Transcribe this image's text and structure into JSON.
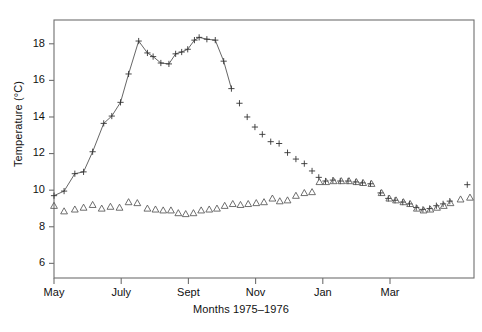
{
  "chart_data": {
    "type": "scatter",
    "title": "",
    "subtitle": "",
    "xlabel": "Months 1975–1976",
    "ylabel": "Temperature (°C)",
    "xlim": [
      0,
      12.5
    ],
    "ylim": [
      5.2,
      19.3
    ],
    "grid": false,
    "legend_position": "none",
    "y_ticks": [
      6,
      8,
      10,
      12,
      14,
      16,
      18
    ],
    "y_tick_labels": [
      "6",
      "8",
      "10",
      "12",
      "14",
      "16",
      "18"
    ],
    "x_ticks": [
      0,
      2,
      4,
      6,
      8,
      10
    ],
    "x_tick_labels": [
      "May",
      "July",
      "Sept",
      "Nov",
      "Jan",
      "Mar"
    ],
    "marker_styles": {
      "surface": "plus",
      "bottom": "triangle-up"
    },
    "annotations": [],
    "series": [
      {
        "name": "surface",
        "marker": "plus",
        "connected_through_x": 5.35,
        "points": [
          {
            "x": 0.0,
            "y": 9.7
          },
          {
            "x": 0.3,
            "y": 9.95
          },
          {
            "x": 0.62,
            "y": 10.9
          },
          {
            "x": 0.88,
            "y": 11.0
          },
          {
            "x": 1.15,
            "y": 12.1
          },
          {
            "x": 1.48,
            "y": 13.65
          },
          {
            "x": 1.72,
            "y": 14.05
          },
          {
            "x": 1.98,
            "y": 14.8
          },
          {
            "x": 2.22,
            "y": 16.35
          },
          {
            "x": 2.52,
            "y": 18.15
          },
          {
            "x": 2.78,
            "y": 17.5
          },
          {
            "x": 2.95,
            "y": 17.3
          },
          {
            "x": 3.18,
            "y": 16.95
          },
          {
            "x": 3.42,
            "y": 16.9
          },
          {
            "x": 3.62,
            "y": 17.45
          },
          {
            "x": 3.8,
            "y": 17.55
          },
          {
            "x": 3.98,
            "y": 17.7
          },
          {
            "x": 4.18,
            "y": 18.2
          },
          {
            "x": 4.32,
            "y": 18.35
          },
          {
            "x": 4.55,
            "y": 18.25
          },
          {
            "x": 4.8,
            "y": 18.2
          },
          {
            "x": 5.05,
            "y": 17.05
          },
          {
            "x": 5.28,
            "y": 15.55
          },
          {
            "x": 5.52,
            "y": 14.75
          },
          {
            "x": 5.75,
            "y": 14.0
          },
          {
            "x": 5.98,
            "y": 13.45
          },
          {
            "x": 6.2,
            "y": 13.05
          },
          {
            "x": 6.45,
            "y": 12.65
          },
          {
            "x": 6.7,
            "y": 12.55
          },
          {
            "x": 6.95,
            "y": 12.05
          },
          {
            "x": 7.2,
            "y": 11.7
          },
          {
            "x": 7.45,
            "y": 11.45
          },
          {
            "x": 7.68,
            "y": 11.05
          },
          {
            "x": 7.88,
            "y": 10.7
          },
          {
            "x": 8.08,
            "y": 10.5
          },
          {
            "x": 8.3,
            "y": 10.55
          },
          {
            "x": 8.52,
            "y": 10.5
          },
          {
            "x": 8.75,
            "y": 10.5
          },
          {
            "x": 8.98,
            "y": 10.45
          },
          {
            "x": 9.18,
            "y": 10.4
          },
          {
            "x": 9.42,
            "y": 10.35
          },
          {
            "x": 9.72,
            "y": 9.85
          },
          {
            "x": 9.95,
            "y": 9.55
          },
          {
            "x": 10.15,
            "y": 9.45
          },
          {
            "x": 10.38,
            "y": 9.35
          },
          {
            "x": 10.58,
            "y": 9.25
          },
          {
            "x": 10.78,
            "y": 9.05
          },
          {
            "x": 10.98,
            "y": 8.95
          },
          {
            "x": 11.18,
            "y": 9.0
          },
          {
            "x": 11.38,
            "y": 9.15
          },
          {
            "x": 11.58,
            "y": 9.25
          },
          {
            "x": 11.78,
            "y": 9.4
          },
          {
            "x": 12.3,
            "y": 10.3
          }
        ]
      },
      {
        "name": "bottom",
        "marker": "triangle-up",
        "connected_through_x": null,
        "points": [
          {
            "x": 0.0,
            "y": 9.15
          },
          {
            "x": 0.3,
            "y": 8.85
          },
          {
            "x": 0.62,
            "y": 8.95
          },
          {
            "x": 0.88,
            "y": 9.05
          },
          {
            "x": 1.15,
            "y": 9.2
          },
          {
            "x": 1.42,
            "y": 9.0
          },
          {
            "x": 1.68,
            "y": 9.1
          },
          {
            "x": 1.95,
            "y": 9.05
          },
          {
            "x": 2.22,
            "y": 9.35
          },
          {
            "x": 2.48,
            "y": 9.3
          },
          {
            "x": 2.78,
            "y": 9.0
          },
          {
            "x": 3.02,
            "y": 8.95
          },
          {
            "x": 3.25,
            "y": 8.9
          },
          {
            "x": 3.48,
            "y": 8.9
          },
          {
            "x": 3.7,
            "y": 8.75
          },
          {
            "x": 3.92,
            "y": 8.7
          },
          {
            "x": 4.15,
            "y": 8.75
          },
          {
            "x": 4.38,
            "y": 8.9
          },
          {
            "x": 4.62,
            "y": 8.95
          },
          {
            "x": 4.85,
            "y": 9.0
          },
          {
            "x": 5.08,
            "y": 9.15
          },
          {
            "x": 5.32,
            "y": 9.25
          },
          {
            "x": 5.55,
            "y": 9.2
          },
          {
            "x": 5.78,
            "y": 9.25
          },
          {
            "x": 6.02,
            "y": 9.3
          },
          {
            "x": 6.25,
            "y": 9.35
          },
          {
            "x": 6.5,
            "y": 9.55
          },
          {
            "x": 6.72,
            "y": 9.4
          },
          {
            "x": 6.95,
            "y": 9.45
          },
          {
            "x": 7.2,
            "y": 9.7
          },
          {
            "x": 7.45,
            "y": 9.85
          },
          {
            "x": 7.68,
            "y": 9.9
          },
          {
            "x": 7.9,
            "y": 10.45
          },
          {
            "x": 8.1,
            "y": 10.45
          },
          {
            "x": 8.32,
            "y": 10.5
          },
          {
            "x": 8.55,
            "y": 10.5
          },
          {
            "x": 8.78,
            "y": 10.5
          },
          {
            "x": 9.0,
            "y": 10.45
          },
          {
            "x": 9.2,
            "y": 10.4
          },
          {
            "x": 9.45,
            "y": 10.35
          },
          {
            "x": 9.75,
            "y": 9.85
          },
          {
            "x": 9.98,
            "y": 9.55
          },
          {
            "x": 10.18,
            "y": 9.45
          },
          {
            "x": 10.4,
            "y": 9.35
          },
          {
            "x": 10.6,
            "y": 9.25
          },
          {
            "x": 10.8,
            "y": 9.0
          },
          {
            "x": 11.0,
            "y": 8.9
          },
          {
            "x": 11.2,
            "y": 8.95
          },
          {
            "x": 11.4,
            "y": 9.05
          },
          {
            "x": 11.6,
            "y": 9.15
          },
          {
            "x": 11.8,
            "y": 9.3
          },
          {
            "x": 12.1,
            "y": 9.5
          },
          {
            "x": 12.38,
            "y": 9.6
          }
        ]
      }
    ]
  }
}
